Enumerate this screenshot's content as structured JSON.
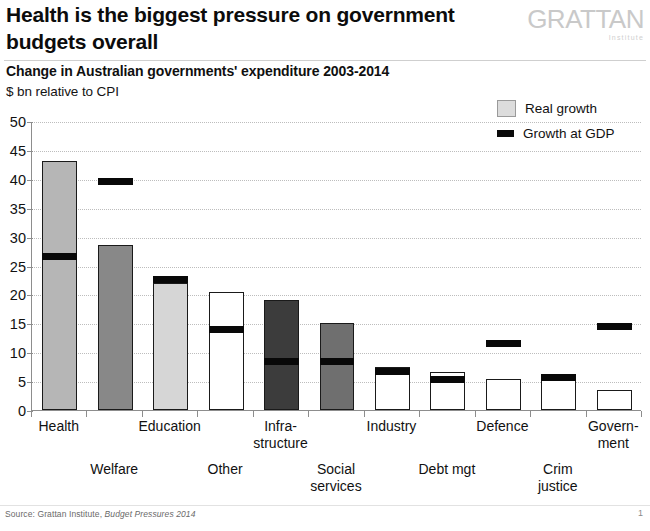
{
  "header": {
    "title": "Health is the biggest pressure on government budgets overall",
    "logo_wordmark": "GRATTAN",
    "logo_sub": "Institute"
  },
  "chart_header": {
    "subtitle": "Change in Australian governments' expenditure 2003-2014",
    "units": "$ bn relative to CPI"
  },
  "legend": {
    "items": [
      {
        "label": "Real growth",
        "marker": "box-swatch",
        "color": "#dcdcdc"
      },
      {
        "label": "Growth at GDP",
        "marker": "bar-swatch",
        "color": "#080808"
      }
    ]
  },
  "footer": {
    "source_prefix": "Source: Grattan Institute, ",
    "source_italic": "Budget Pressures 2014",
    "page_number": "1"
  },
  "chart_data": {
    "type": "bar",
    "title": "Change in Australian governments' expenditure 2003-2014",
    "subtitle": "$ bn relative to CPI",
    "xlabel": "",
    "ylabel": "$ bn relative to CPI",
    "ylim": [
      0,
      50
    ],
    "yticks": [
      0,
      5,
      10,
      15,
      20,
      25,
      30,
      35,
      40,
      45,
      50
    ],
    "grid": true,
    "legend_position": "top-right",
    "categories": [
      "Health",
      "Welfare",
      "Education",
      "Other",
      "Infra-structure",
      "Social services",
      "Industry",
      "Debt mgt",
      "Defence",
      "Crim justice",
      "Government"
    ],
    "category_label_rows": [
      "Health",
      "Welfare",
      "Education",
      "Other",
      "Infra-\nstructure",
      "Social\nservices",
      "Industry",
      "Debt mgt",
      "Defence",
      "Crim\njustice",
      "Govern-\nment"
    ],
    "series": [
      {
        "name": "Real growth",
        "values": [
          43.0,
          28.5,
          22.0,
          20.5,
          19.0,
          15.0,
          7.5,
          6.5,
          5.3,
          5.4,
          3.4
        ]
      },
      {
        "name": "Growth at GDP",
        "values": [
          26.5,
          39.5,
          22.5,
          14.0,
          8.4,
          8.4,
          6.6,
          5.3,
          11.5,
          5.7,
          14.5
        ]
      }
    ],
    "bar_fills": [
      "#b6b6b6",
      "#888888",
      "#d6d6d6",
      "#ffffff",
      "#3c3c3c",
      "#6f6f6f",
      "#ffffff",
      "#ffffff",
      "#ffffff",
      "#ffffff",
      "#ffffff"
    ]
  }
}
